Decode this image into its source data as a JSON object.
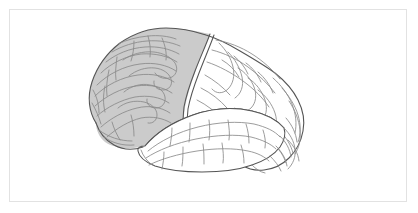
{
  "figure": {
    "title": "Human brain, lateral view",
    "background_color": "#ffffff",
    "frame": {
      "color": "#e2e2e2",
      "x": 9,
      "y": 9,
      "width": 398,
      "height": 193,
      "stroke_width": 1
    },
    "canvas": {
      "width": 418,
      "height": 213
    }
  },
  "illustration": {
    "style": "line-drawing",
    "outline_color": "#555555",
    "sulci_color": "#8a8a8a",
    "highlight_region_fill": "#cccccc",
    "unshaded_region_fill": "#ffffff",
    "orientation": "left-facing lateral (anterior at left, posterior at right)"
  },
  "regions": [
    {
      "id": "frontal-lobe",
      "label": "Frontal lobe",
      "shaded": true,
      "fill": "#cbcbcb",
      "position": "anterior-superior, left portion"
    },
    {
      "id": "parietal-lobe",
      "label": "Parietal lobe",
      "shaded": false,
      "fill": "#ffffff",
      "position": "superior-posterior, upper right"
    },
    {
      "id": "occipital-lobe",
      "label": "Occipital lobe",
      "shaded": false,
      "fill": "#ffffff",
      "position": "posterior, far right"
    },
    {
      "id": "temporal-lobe",
      "label": "Temporal lobe",
      "shaded": false,
      "fill": "#ffffff",
      "position": "inferior, lower center"
    },
    {
      "id": "cerebellum",
      "label": "Cerebellum",
      "shaded": false,
      "fill": "#ffffff",
      "position": "postero-inferior, lower right"
    }
  ],
  "landmarks": [
    {
      "id": "central-sulcus",
      "label": "Central sulcus"
    },
    {
      "id": "lateral-sulcus",
      "label": "Lateral (Sylvian) fissure"
    },
    {
      "id": "frontal-pole",
      "label": "Frontal pole"
    },
    {
      "id": "occipital-pole",
      "label": "Occipital pole"
    },
    {
      "id": "temporal-pole",
      "label": "Temporal pole"
    }
  ]
}
